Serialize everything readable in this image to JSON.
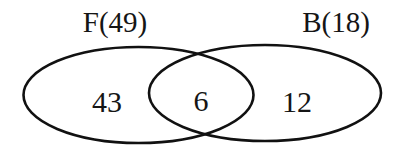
{
  "diagram": {
    "type": "venn",
    "sets": [
      {
        "id": "F",
        "label": "F(49)",
        "total": 49
      },
      {
        "id": "B",
        "label": "B(18)",
        "total": 18
      }
    ],
    "regions": {
      "F_only": "43",
      "intersection": "6",
      "B_only": "12"
    },
    "colors": {
      "stroke": "#111111",
      "text": "#151515",
      "background": "#ffffff"
    }
  }
}
